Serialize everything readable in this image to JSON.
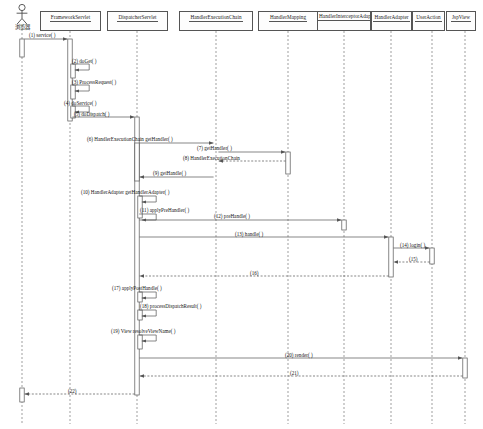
{
  "diagram": {
    "kind": "uml-sequence-diagram",
    "caption": "",
    "colors": {
      "line": "#555555",
      "lifeline_dash": "#777777",
      "box_fill": "#fdfdfd",
      "text": "#141414",
      "activation_fill": "#ffffff"
    }
  },
  "actor": {
    "name": "browser-actor",
    "label": "浏览器",
    "x": 22,
    "head_y": 6
  },
  "participants": [
    {
      "id": "framework-servlet",
      "label": "FrameworkServlet",
      "x": 70,
      "box_x": 40,
      "box_y": 11,
      "box_w": 61,
      "box_h": 20,
      "lines": 1
    },
    {
      "id": "dispatcher-servlet",
      "label": "DispatcherServlet",
      "x": 137,
      "box_x": 107,
      "box_y": 11,
      "box_w": 61,
      "box_h": 20,
      "lines": 1
    },
    {
      "id": "handler-execution-chain",
      "label": "HandlerExecutionChain",
      "x": 216,
      "box_x": 179,
      "box_y": 11,
      "box_w": 74,
      "box_h": 20,
      "lines": 1
    },
    {
      "id": "handler-mapping",
      "label": "HandlerMapping",
      "x": 288,
      "box_x": 258,
      "box_y": 11,
      "box_w": 60,
      "box_h": 20,
      "lines": 1
    },
    {
      "id": "handler-interceptor-adapter",
      "label": "HandlerInterceptorAdapter",
      "x": 344,
      "box_x": 317,
      "box_y": 11,
      "box_w": 54,
      "box_h": 20,
      "lines": 2
    },
    {
      "id": "handler-adapter",
      "label": "HandlerAdapter",
      "x": 391,
      "box_x": 371,
      "box_y": 11,
      "box_w": 41,
      "box_h": 20,
      "lines": 1
    },
    {
      "id": "user-action",
      "label": "UserAction",
      "x": 432,
      "box_x": 412,
      "box_y": 11,
      "box_w": 33,
      "box_h": 20,
      "lines": 1
    },
    {
      "id": "jsp-view",
      "label": "JspView",
      "x": 465,
      "box_x": 446,
      "box_y": 11,
      "box_w": 30,
      "box_h": 20,
      "lines": 1
    }
  ],
  "messages": [
    {
      "num": "1",
      "text": "(1) service( )",
      "from": "browser-actor",
      "to": "framework-servlet",
      "y": 39,
      "label_x": 29,
      "label_y": 32,
      "kind": "call"
    },
    {
      "num": "2",
      "text": "(2) doGet( )",
      "from": "framework-servlet",
      "to": "framework-servlet",
      "y": 64,
      "label_x": 72,
      "label_y": 58,
      "kind": "self"
    },
    {
      "num": "3",
      "text": "(3) ProcessRequest( )",
      "from": "framework-servlet",
      "to": "framework-servlet",
      "y": 85,
      "label_x": 72,
      "label_y": 79,
      "kind": "self"
    },
    {
      "num": "4",
      "text": "(4) doService( )",
      "from": "framework-servlet",
      "to": "framework-servlet",
      "y": 106,
      "label_x": 64,
      "label_y": 100,
      "kind": "self"
    },
    {
      "num": "5",
      "text": "(5) doDispatch( )",
      "from": "framework-servlet",
      "to": "dispatcher-servlet",
      "y": 117,
      "label_x": 74,
      "label_y": 111,
      "kind": "call"
    },
    {
      "num": "6",
      "text": "(6) HandlerExecutionChain getHandler( )",
      "from": "dispatcher-servlet",
      "to": "handler-execution-chain",
      "y": 143,
      "label_x": 87,
      "label_y": 136,
      "kind": "call"
    },
    {
      "num": "7",
      "text": "(7) getHandler( )",
      "from": "handler-execution-chain",
      "to": "handler-mapping",
      "y": 152,
      "label_x": 197,
      "label_y": 145,
      "kind": "call"
    },
    {
      "num": "8",
      "text": "(8) HandlerExecutionChain",
      "from": "handler-mapping",
      "to": "handler-execution-chain",
      "y": 161,
      "label_x": 183,
      "label_y": 155,
      "kind": "return"
    },
    {
      "num": "9",
      "text": "(9) getHandle( )",
      "from": "handler-execution-chain",
      "to": "dispatcher-servlet",
      "y": 177,
      "label_x": 153,
      "label_y": 170,
      "kind": "return-solid"
    },
    {
      "num": "10",
      "text": "(10) HandlerAdapter getHandlerAdapter( )",
      "from": "dispatcher-servlet",
      "to": "dispatcher-servlet",
      "y": 196,
      "label_x": 81,
      "label_y": 189,
      "kind": "self"
    },
    {
      "num": "11",
      "text": "(11) applyPreHandler( )",
      "from": "dispatcher-servlet",
      "to": "dispatcher-servlet",
      "y": 214,
      "label_x": 140,
      "label_y": 207,
      "kind": "self"
    },
    {
      "num": "12",
      "text": "(12) preHandle( )",
      "from": "dispatcher-servlet",
      "to": "handler-interceptor-adapter",
      "y": 220,
      "label_x": 214,
      "label_y": 213,
      "kind": "call"
    },
    {
      "num": "13",
      "text": "(13) handle( )",
      "from": "dispatcher-servlet",
      "to": "handler-adapter",
      "y": 237,
      "label_x": 235,
      "label_y": 231,
      "kind": "call"
    },
    {
      "num": "14",
      "text": "(14) login( )",
      "from": "handler-adapter",
      "to": "user-action",
      "y": 248,
      "label_x": 400,
      "label_y": 242,
      "kind": "call"
    },
    {
      "num": "15",
      "text": "(15)",
      "from": "user-action",
      "to": "handler-adapter",
      "y": 262,
      "label_x": 409,
      "label_y": 256,
      "kind": "return"
    },
    {
      "num": "16",
      "text": "(16)",
      "from": "handler-adapter",
      "to": "dispatcher-servlet",
      "y": 276,
      "label_x": 250,
      "label_y": 270,
      "kind": "return"
    },
    {
      "num": "17",
      "text": "(17) applyPostHandle( )",
      "from": "dispatcher-servlet",
      "to": "dispatcher-servlet",
      "y": 292,
      "label_x": 112,
      "label_y": 285,
      "kind": "self"
    },
    {
      "num": "18",
      "text": "(18) processDispatchResult( )",
      "from": "dispatcher-servlet",
      "to": "dispatcher-servlet",
      "y": 310,
      "label_x": 140,
      "label_y": 303,
      "kind": "self"
    },
    {
      "num": "19",
      "text": "(19) View resolveViewName( )",
      "from": "dispatcher-servlet",
      "to": "dispatcher-servlet",
      "y": 335,
      "label_x": 111,
      "label_y": 328,
      "kind": "self"
    },
    {
      "num": "20",
      "text": "(20) render( )",
      "from": "dispatcher-servlet",
      "to": "jsp-view",
      "y": 358,
      "label_x": 285,
      "label_y": 352,
      "kind": "call"
    },
    {
      "num": "21",
      "text": "(21)",
      "from": "jsp-view",
      "to": "dispatcher-servlet",
      "y": 376,
      "label_x": 290,
      "label_y": 370,
      "kind": "return"
    },
    {
      "num": "22",
      "text": "(22)",
      "from": "dispatcher-servlet",
      "to": "browser-actor",
      "y": 394,
      "label_x": 68,
      "label_y": 388,
      "kind": "return"
    }
  ],
  "activations": [
    {
      "on": "browser-actor",
      "x": 22,
      "y": 39,
      "h": 18
    },
    {
      "on": "browser-actor",
      "x": 22,
      "y": 388,
      "h": 14
    },
    {
      "on": "framework-servlet",
      "x": 70,
      "y": 39,
      "h": 82
    },
    {
      "on": "framework-servlet",
      "x": 73,
      "y": 64,
      "h": 14
    },
    {
      "on": "framework-servlet",
      "x": 73,
      "y": 85,
      "h": 14
    },
    {
      "on": "framework-servlet",
      "x": 73,
      "y": 106,
      "h": 12
    },
    {
      "on": "dispatcher-servlet",
      "x": 137,
      "y": 117,
      "h": 278
    },
    {
      "on": "dispatcher-servlet",
      "x": 140,
      "y": 196,
      "h": 22
    },
    {
      "on": "dispatcher-servlet",
      "x": 140,
      "y": 292,
      "h": 10
    },
    {
      "on": "dispatcher-servlet",
      "x": 140,
      "y": 310,
      "h": 10
    },
    {
      "on": "dispatcher-servlet",
      "x": 140,
      "y": 335,
      "h": 14
    },
    {
      "on": "handler-execution-chain",
      "x": 137,
      "y": 143,
      "h": 38
    },
    {
      "on": "handler-mapping",
      "x": 288,
      "y": 152,
      "h": 22
    },
    {
      "on": "handler-interceptor-adapter",
      "x": 344,
      "y": 220,
      "h": 10
    },
    {
      "on": "handler-adapter",
      "x": 391,
      "y": 237,
      "h": 40
    },
    {
      "on": "user-action",
      "x": 432,
      "y": 248,
      "h": 16
    },
    {
      "on": "jsp-view",
      "x": 465,
      "y": 358,
      "h": 20
    }
  ],
  "lifeline_bottom": 424
}
